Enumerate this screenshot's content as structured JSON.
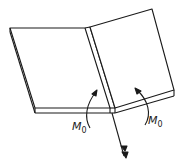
{
  "diagram": {
    "type": "folded-plate-bending",
    "labels": {
      "moment_left": "M",
      "moment_left_sub": "0",
      "moment_right": "M",
      "moment_right_sub": "0"
    },
    "colors": {
      "stroke": "#1a1a1a",
      "background": "#ffffff"
    }
  }
}
